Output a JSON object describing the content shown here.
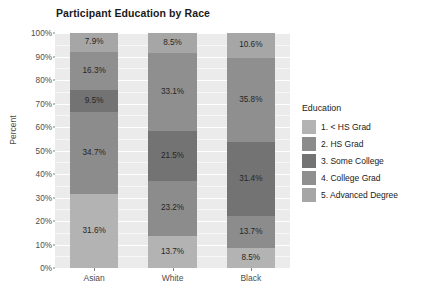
{
  "chart_data": {
    "type": "bar",
    "subtype": "stacked-100-percent",
    "title": "Participant Education by Race",
    "xlabel": "",
    "ylabel": "Percent",
    "categories": [
      "Asian",
      "White",
      "Black"
    ],
    "ylim": [
      0,
      100
    ],
    "ytick_labels": [
      "0%",
      "10%",
      "20%",
      "30%",
      "40%",
      "50%",
      "60%",
      "70%",
      "80%",
      "90%",
      "100%"
    ],
    "ytick_values": [
      0,
      10,
      20,
      30,
      40,
      50,
      60,
      70,
      80,
      90,
      100
    ],
    "grid": true,
    "legend_position": "right",
    "legend_title": "Education",
    "series": [
      {
        "name": "1. < HS Grad",
        "color": "#b3b3b3",
        "values": [
          31.6,
          13.7,
          8.5
        ],
        "labels": [
          "31.6%",
          "13.7%",
          "8.5%"
        ]
      },
      {
        "name": "2. HS Grad",
        "color": "#8c8c8c",
        "values": [
          34.7,
          23.2,
          13.7
        ],
        "labels": [
          "34.7%",
          "23.2%",
          "13.7%"
        ]
      },
      {
        "name": "3. Some College",
        "color": "#737373",
        "values": [
          9.5,
          21.5,
          31.4
        ],
        "labels": [
          "9.5%",
          "21.5%",
          "31.4%"
        ]
      },
      {
        "name": "4. College Grad",
        "color": "#8f8f8f",
        "values": [
          16.3,
          33.1,
          35.8
        ],
        "labels": [
          "16.3%",
          "33.1%",
          "35.8%"
        ]
      },
      {
        "name": "5. Advanced Degree",
        "color": "#a6a6a6",
        "values": [
          7.9,
          8.5,
          10.6
        ],
        "labels": [
          "7.9%",
          "8.5%",
          "10.6%"
        ]
      }
    ]
  },
  "colors": {
    "panel_background": "#ebebeb",
    "gridline": "#ffffff",
    "text": "#4d4d4d",
    "title_text": "#1a1a1a"
  }
}
